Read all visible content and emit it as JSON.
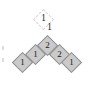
{
  "figure": {
    "name": "numbered-diamond-chevron",
    "background_color": "#ffffff",
    "tile_fill": "#cacaca",
    "tile_stroke": "#8e8e8e",
    "ghost_stroke": "#d8d8d8",
    "text_color": "#1a1a1a"
  },
  "ghost_tiles": [
    {
      "id": "ghost-apex",
      "label": "1",
      "x": 36,
      "y": 12
    }
  ],
  "floating_labels": [
    {
      "id": "label-top",
      "text": "1",
      "x": 41,
      "y": 13,
      "faint": false
    },
    {
      "id": "label-upper",
      "text": "1",
      "x": 47,
      "y": 22,
      "faint": false
    }
  ],
  "tiles": [
    {
      "id": "tile-left-outer",
      "label": "1",
      "x": 15,
      "y": 55,
      "row": "left-arm",
      "index": 0
    },
    {
      "id": "tile-left-inner",
      "label": "1",
      "x": 28,
      "y": 47,
      "row": "left-arm",
      "index": 1
    },
    {
      "id": "tile-apex",
      "label": "2",
      "x": 40,
      "y": 38,
      "row": "apex",
      "index": 2
    },
    {
      "id": "tile-right-inner",
      "label": "2",
      "x": 52,
      "y": 47,
      "row": "right-arm",
      "index": 3
    },
    {
      "id": "tile-right-outer",
      "label": "1",
      "x": 64,
      "y": 55,
      "row": "right-arm",
      "index": 4
    }
  ],
  "specks": [
    {
      "id": "speck-left-upper",
      "x": 2,
      "y": 46,
      "w": 2,
      "h": 4
    },
    {
      "id": "speck-left-lower",
      "x": 2,
      "y": 58,
      "w": 2,
      "h": 4
    }
  ]
}
